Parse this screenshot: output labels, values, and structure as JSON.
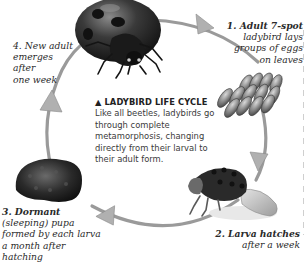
{
  "figure": {
    "center": {
      "title_marker": "▲",
      "title": "LADYBIRD LIFE CYCLE",
      "body": "Like all beetles, ladybirds go through complete metamorphosis, changing directly from their larval to their adult form."
    },
    "stages": [
      {
        "number": "1.",
        "lead": "Adult 7-spot",
        "rest_lines": [
          "ladybird lays",
          "groups of eggs",
          "on leaves"
        ],
        "image": "egg-cluster"
      },
      {
        "number": "2.",
        "lead": "Larva hatches",
        "rest_lines": [
          "after a week"
        ],
        "image": "larva"
      },
      {
        "number": "3.",
        "lead": "Dormant",
        "rest_lines": [
          "(sleeping) pupa",
          "formed by each larva",
          "a month after hatching"
        ],
        "image": "pupa"
      },
      {
        "number": "4.",
        "lead": "New adult",
        "rest_lines": [
          "emerges after",
          "one week"
        ],
        "image": "adult-ladybird"
      }
    ],
    "colors": {
      "background": "#ffffff",
      "cycle_arrow": "#9a9a9a",
      "arrow_head": "#b0b0b0",
      "text": "#2a2a2a"
    }
  }
}
